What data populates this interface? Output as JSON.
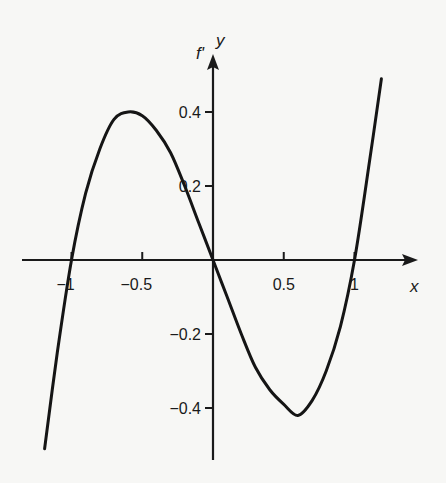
{
  "chart_data": {
    "type": "line",
    "title": "",
    "xlabel": "x",
    "ylabel": "y",
    "function_label": "f'",
    "xlim": [
      -1.2,
      1.2
    ],
    "ylim": [
      -0.5,
      0.5
    ],
    "x_ticks": [
      {
        "value": -1,
        "label": "-1"
      },
      {
        "value": -0.5,
        "label": "-0.5"
      },
      {
        "value": 0.5,
        "label": "0.5"
      },
      {
        "value": 1,
        "label": "1"
      }
    ],
    "y_ticks": [
      {
        "value": 0.4,
        "label": "0.4"
      },
      {
        "value": 0.2,
        "label": "0.2"
      },
      {
        "value": -0.2,
        "label": "-0.2"
      },
      {
        "value": -0.4,
        "label": "-0.4"
      }
    ],
    "grid": false,
    "legend": null,
    "series": [
      {
        "name": "f'",
        "x": [
          -1.19,
          -1.1,
          -1.0,
          -0.9,
          -0.8,
          -0.7,
          -0.6,
          -0.5,
          -0.4,
          -0.3,
          -0.2,
          -0.1,
          0.0,
          0.1,
          0.2,
          0.3,
          0.4,
          0.5,
          0.6,
          0.7,
          0.8,
          0.9,
          1.0,
          1.1,
          1.19
        ],
        "y": [
          -0.51,
          -0.25,
          0.0,
          0.18,
          0.3,
          0.38,
          0.4,
          0.39,
          0.35,
          0.29,
          0.2,
          0.1,
          0.0,
          -0.1,
          -0.2,
          -0.29,
          -0.35,
          -0.39,
          -0.42,
          -0.38,
          -0.3,
          -0.18,
          0.0,
          0.25,
          0.49
        ]
      }
    ],
    "key_points": {
      "local_max": {
        "x": -0.58,
        "y": 0.4
      },
      "local_min": {
        "x": 0.6,
        "y": -0.42
      },
      "zeros": [
        -1,
        0,
        1
      ]
    }
  }
}
